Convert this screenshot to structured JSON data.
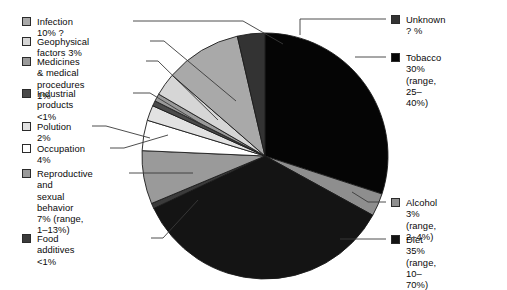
{
  "chart_data": {
    "type": "pie",
    "title": "",
    "units": "percent of cancer deaths attributable to each factor",
    "legend_position": "left and right of pie",
    "start_angle_deg": 0,
    "direction": "clockwise",
    "center": {
      "x": 265,
      "y": 156
    },
    "radius": 123,
    "categories": [
      "Tobacco",
      "Alcohol",
      "Diet",
      "Food additives",
      "Reproductive and sexual behavior",
      "Occupation",
      "Polution",
      "Industrial products",
      "Medicines & medical procedures",
      "Geophysical factors",
      "Infection",
      "Unknown"
    ],
    "values": [
      30,
      3,
      35,
      0.7,
      7,
      4,
      2,
      0.7,
      1,
      3,
      10,
      3.6
    ],
    "slices": [
      {
        "label": "Tobacco",
        "value": 30,
        "value_text": "30%",
        "range_text": "(range, 25–40%)",
        "color": "#050505",
        "start_deg": 0,
        "end_deg": 108.0
      },
      {
        "label": "Alcohol",
        "value": 3,
        "value_text": "3%",
        "range_text": "(range, 2–4%)",
        "color": "#8e8e8e",
        "start_deg": 108.0,
        "end_deg": 118.8
      },
      {
        "label": "Diet",
        "value": 35,
        "value_text": "35%",
        "range_text": "(range, 10–70%)",
        "color": "#141414",
        "start_deg": 118.8,
        "end_deg": 244.8
      },
      {
        "label": "Food additives",
        "value": 0.7,
        "value_text": "<1%",
        "range_text": "",
        "color": "#3b3b3b",
        "start_deg": 244.8,
        "end_deg": 247.3
      },
      {
        "label": "Reproductive and sexual behavior",
        "value": 7,
        "value_text": "7%",
        "range_text": "(range, 1–13%)",
        "color": "#9a9a9a",
        "start_deg": 247.3,
        "end_deg": 272.5
      },
      {
        "label": "Occupation",
        "value": 4,
        "value_text": "4%",
        "range_text": "",
        "color": "#ffffff",
        "start_deg": 272.5,
        "end_deg": 286.9
      },
      {
        "label": "Polution",
        "value": 2,
        "value_text": "2%",
        "range_text": "",
        "color": "#e2e2e2",
        "start_deg": 286.9,
        "end_deg": 294.1
      },
      {
        "label": "Industrial products",
        "value": 0.7,
        "value_text": "<1%",
        "range_text": "",
        "color": "#4a4a4a",
        "start_deg": 294.1,
        "end_deg": 296.6
      },
      {
        "label": "Medicines & medical procedures",
        "value": 1,
        "value_text": "1%",
        "range_text": "",
        "color": "#9a9a9a",
        "start_deg": 296.6,
        "end_deg": 300.2
      },
      {
        "label": "Geophysical factors",
        "value": 3,
        "value_text": "3%",
        "range_text": "",
        "color": "#d6d6d6",
        "start_deg": 300.2,
        "end_deg": 311.0
      },
      {
        "label": "Infection",
        "value": 10,
        "value_text": "10% ?",
        "range_text": "",
        "color": "#a9a9a9",
        "start_deg": 311.0,
        "end_deg": 347.0
      },
      {
        "label": "Unknown",
        "value": 3.6,
        "value_text": "? %",
        "range_text": "",
        "color": "#333333",
        "start_deg": 347.0,
        "end_deg": 360.0
      }
    ]
  },
  "legend_left": {
    "items": [
      {
        "id": "infection",
        "label": "Infection 10% ?",
        "color": "#a9a9a9"
      },
      {
        "id": "geophysical",
        "label": "Geophysical factors 3%",
        "color": "#d6d6d6"
      },
      {
        "id": "medicines",
        "label": "Medicines & medical\nprocedures 1%",
        "color": "#9a9a9a"
      },
      {
        "id": "industrial",
        "label": "Industrial products\n<1%",
        "color": "#4a4a4a"
      },
      {
        "id": "polution",
        "label": "Polution 2%",
        "color": "#e2e2e2"
      },
      {
        "id": "occupation",
        "label": "Occupation 4%",
        "color": "#ffffff"
      },
      {
        "id": "reproductive",
        "label": "Reproductive and\nsexual behavior\n7% (range, 1–13%)",
        "color": "#9a9a9a"
      },
      {
        "id": "foodadd",
        "label": "Food additives <1%",
        "color": "#3b3b3b"
      }
    ]
  },
  "legend_right": {
    "items": [
      {
        "id": "unknown",
        "label": "Unknown ? %",
        "color": "#333333"
      },
      {
        "id": "tobacco",
        "label": "Tobacco 30%\n(range, 25–40%)",
        "color": "#050505"
      },
      {
        "id": "alcohol",
        "label": "Alcohol 3%\n(range, 2–4%)",
        "color": "#8e8e8e"
      },
      {
        "id": "diet",
        "label": "Diet 35%\n(range, 10–70%)",
        "color": "#141414"
      }
    ]
  }
}
